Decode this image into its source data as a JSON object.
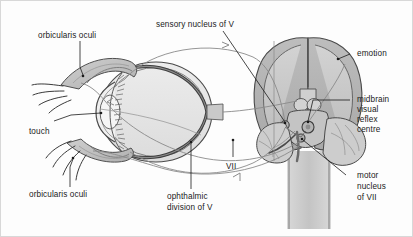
{
  "figure": {
    "background_color": "#fdfdfd",
    "border_color": "#d8d8d8",
    "ink_color": "#1a1a1a",
    "shade_mid": "#b9b9b9",
    "shade_light": "#d6d6d6",
    "shade_dark": "#9a9a9a"
  },
  "labels": {
    "orbicularis_oculi_top": "orbicularis oculi",
    "sensory_nucleus_of_v": "sensory nucleus of V",
    "emotion": "emotion",
    "midbrain_l1": "midbrain",
    "midbrain_l2": "visual",
    "midbrain_l3": "reflex",
    "midbrain_l4": "centre",
    "touch": "touch",
    "orbicularis_oculi_bottom": "orbicularis oculi",
    "ophthalmic_l1": "ophthalmic",
    "ophthalmic_l2": "division of V",
    "vii": "VII",
    "motor_l1": "motor",
    "motor_l2": "nucleus",
    "motor_l3": "of VII"
  },
  "structures": {
    "eye": "sagittal section of the eye with eyelids and eyelashes",
    "orbicularis_muscle": "shaded orbicularis oculi muscle in upper and lower eyelid",
    "brain": "inferior view of cerebral hemispheres, midbrain, cerebellum and brainstem",
    "pathways": [
      "ophthalmic division of V afferent from cornea to sensory nucleus of V",
      "sensory nucleus of V to motor nucleus of VII",
      "midbrain visual reflex centre to motor nucleus of VII",
      "emotion (cortex) to motor nucleus of VII",
      "VII efferent to orbicularis oculi"
    ]
  }
}
